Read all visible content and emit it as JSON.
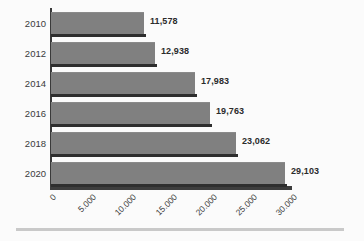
{
  "chart_data": {
    "type": "bar",
    "orientation": "horizontal",
    "title": "",
    "subtitle": "",
    "xlabel": "",
    "ylabel": "",
    "categories": [
      "2010",
      "2012",
      "2014",
      "2016",
      "2018",
      "2020"
    ],
    "values": [
      11578,
      12938,
      17983,
      19763,
      23062,
      29103
    ],
    "data_labels": [
      "11,578",
      "12,938",
      "17,983",
      "19,763",
      "23,062",
      "29,103"
    ],
    "series": [
      {
        "name": "",
        "values": [
          11578,
          12938,
          17983,
          19763,
          23062,
          29103
        ]
      }
    ],
    "xlim": [
      0,
      30000
    ],
    "ylim": null,
    "xticks": [
      0,
      5000,
      10000,
      15000,
      20000,
      25000,
      30000
    ],
    "xtick_labels": [
      "0",
      "5.000",
      "10.000",
      "15.000",
      "20.000",
      "25.000",
      "30.000"
    ],
    "xtick_rotation": -45,
    "grid": false,
    "legend": false,
    "legend_position": "none",
    "colors": {
      "bar_fill": "#808080",
      "bar_shadow": "#2e2e2e",
      "axis": "#3d3d3d",
      "text": "#3a3a3a",
      "value_text": "#2b2b2b",
      "background": "#fbfbfb",
      "bottom_rule": "#c9c9c9"
    }
  }
}
